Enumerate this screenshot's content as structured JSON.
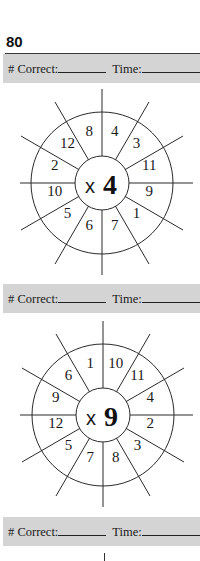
{
  "page": {
    "number": "80"
  },
  "score_bar": {
    "correct_label": "# Correct:",
    "time_label": "Time:"
  },
  "wheels": [
    {
      "multiplier_prefix": "x",
      "multiplier": "4",
      "numbers_clockwise_from_top": [
        "4",
        "3",
        "11",
        "9",
        "1",
        "7",
        "6",
        "5",
        "10",
        "2",
        "12",
        "8"
      ]
    },
    {
      "multiplier_prefix": "x",
      "multiplier": "9",
      "numbers_clockwise_from_top": [
        "10",
        "11",
        "4",
        "2",
        "3",
        "8",
        "7",
        "5",
        "12",
        "9",
        "6",
        "1"
      ]
    }
  ],
  "colors": {
    "bar_bg": "#d4d4d4",
    "rule": "#3a3a3a",
    "ink": "#1a1a1a"
  }
}
